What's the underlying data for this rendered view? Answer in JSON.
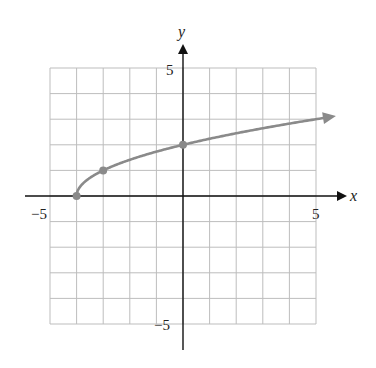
{
  "chart_data": {
    "type": "line",
    "title": "",
    "xlabel": "x",
    "ylabel": "y",
    "xlim": [
      -5,
      5
    ],
    "ylim": [
      -5,
      5
    ],
    "grid": true,
    "tick_labels": {
      "x": [
        "-5",
        "5"
      ],
      "y": [
        "5",
        "-5"
      ]
    },
    "function": "y = sqrt(x + 4)",
    "curve_end_arrow": true,
    "series": [
      {
        "name": "curve",
        "x": [
          -4,
          -3,
          0,
          5
        ],
        "y": [
          0,
          1,
          2,
          3
        ]
      }
    ],
    "marked_points": [
      [
        -4,
        0
      ],
      [
        -3,
        1
      ],
      [
        0,
        2
      ]
    ],
    "colors": {
      "curve": "#8a8a8a",
      "grid": "#bdbdbd",
      "axes": "#111111"
    }
  },
  "labels": {
    "x_axis": "x",
    "y_axis": "y",
    "x_min": "−5",
    "x_max": "5",
    "y_max": "5",
    "y_min": "−5"
  }
}
